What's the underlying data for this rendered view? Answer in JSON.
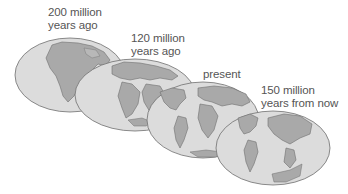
{
  "diagram": {
    "colors": {
      "ocean": "#dcdcdc",
      "land": "#a9a9a9",
      "outline": "#6f6f6f",
      "text": "#555555"
    },
    "globes": [
      {
        "id": "globe-200-mya",
        "label_line1": "200 million",
        "label_line2": "years ago",
        "cx": 70,
        "cy": 75,
        "rx": 55,
        "ry": 37
      },
      {
        "id": "globe-120-mya",
        "label_line1": "120 million",
        "label_line2": "years ago",
        "cx": 135,
        "cy": 95,
        "rx": 60,
        "ry": 36
      },
      {
        "id": "globe-present",
        "label_line1": "present",
        "label_line2": "",
        "cx": 203,
        "cy": 120,
        "rx": 56,
        "ry": 38
      },
      {
        "id": "globe-150-my-future",
        "label_line1": "150 million",
        "label_line2": "years from now",
        "cx": 273,
        "cy": 148,
        "rx": 57,
        "ry": 37
      }
    ]
  }
}
